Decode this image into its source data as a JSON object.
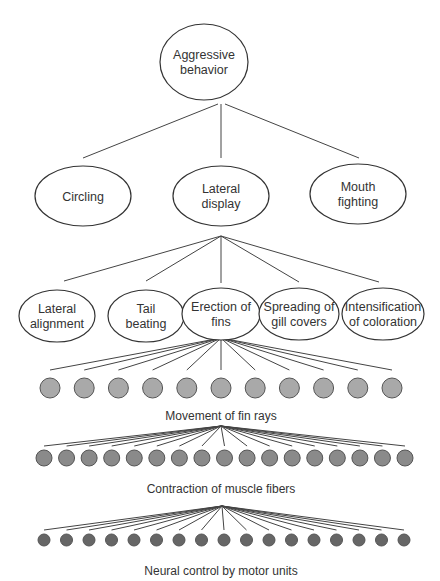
{
  "diagram": {
    "root": {
      "label_lines": [
        "Aggressive",
        "behavior"
      ],
      "cx": 204,
      "cy": 62,
      "rx": 44,
      "ry": 38
    },
    "level2": [
      {
        "label_lines": [
          "Circling"
        ],
        "cx": 83,
        "cy": 196,
        "rx": 48,
        "ry": 30
      },
      {
        "label_lines": [
          "Lateral",
          "display"
        ],
        "cx": 221,
        "cy": 196,
        "rx": 48,
        "ry": 30
      },
      {
        "label_lines": [
          "Mouth",
          "fighting"
        ],
        "cx": 358,
        "cy": 194,
        "rx": 48,
        "ry": 30
      }
    ],
    "level3": [
      {
        "label_lines": [
          "Lateral",
          "alignment"
        ],
        "cx": 57,
        "cy": 316,
        "rx": 38,
        "ry": 26
      },
      {
        "label_lines": [
          "Tail",
          "beating"
        ],
        "cx": 146,
        "cy": 316,
        "rx": 38,
        "ry": 26
      },
      {
        "label_lines": [
          "Erection of",
          "fins"
        ],
        "cx": 221,
        "cy": 314,
        "rx": 39,
        "ry": 26
      },
      {
        "label_lines": [
          "Spreading of",
          "gill covers"
        ],
        "cx": 299,
        "cy": 314,
        "rx": 40,
        "ry": 26
      },
      {
        "label_lines": [
          "Intensification",
          "of coloration"
        ],
        "cx": 383,
        "cy": 314,
        "rx": 41,
        "ry": 26
      }
    ],
    "fin_rays": {
      "caption": "Movement of fin rays",
      "count": 11,
      "color": "#a9a9a9",
      "stroke": "#555555",
      "x_start": 50,
      "x_end": 392,
      "cy": 388,
      "r": 10,
      "origin": [
        221,
        338
      ],
      "line_end_y": 370,
      "caption_y": 420
    },
    "muscle_fibers": {
      "caption": "Contraction of muscle fibers",
      "count": 17,
      "color": "#8a8a8a",
      "stroke": "#555555",
      "x_start": 44,
      "x_end": 405,
      "cy": 458,
      "r": 8,
      "origin": [
        221,
        426
      ],
      "line_end_y": 446,
      "caption_y": 493
    },
    "motor_units": {
      "caption": "Neural control by motor units",
      "count": 17,
      "color": "#666666",
      "stroke": "#555555",
      "x_start": 44,
      "x_end": 404,
      "cy": 540,
      "r": 6,
      "origin": [
        222,
        506
      ],
      "line_end_y": 530,
      "caption_y": 575
    }
  }
}
